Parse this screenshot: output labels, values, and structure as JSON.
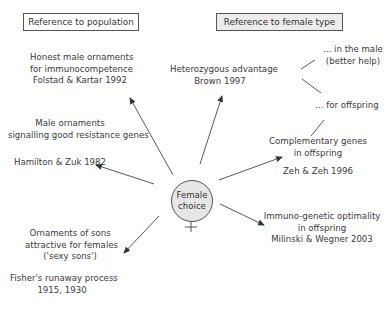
{
  "diagram": {
    "headers": {
      "population": "Reference to population",
      "female_type": "Reference to female type"
    },
    "center": {
      "line1": "Female",
      "line2": "choice",
      "symbol": "female-symbol"
    },
    "nodes": {
      "honest": {
        "line1": "Honest male ornaments",
        "line2": "for immunocompetence",
        "ref": "Folstad & Kartar 1992"
      },
      "male_orn": {
        "line1": "Male ornaments",
        "line2": "signalling good resistance genes",
        "ref": "Hamilton & Zuk 1982"
      },
      "sexy": {
        "line1": "Ornaments of sons",
        "line2": "attractive for females",
        "line3": "('sexy sons')",
        "ref1": "Fisher's runaway process",
        "ref2": "1915, 1930"
      },
      "hetero": {
        "line1": "Heterozygous advantage",
        "ref": "Brown 1997"
      },
      "in_male": {
        "line1": "... in the male",
        "line2": "(better help)"
      },
      "for_offspring": {
        "line1": "... for offspring"
      },
      "complementary": {
        "line1": "Complementary genes",
        "line2": "in offspring",
        "ref": "Zeh & Zeh 1996"
      },
      "immuno": {
        "line1": "Immuno-genetic optimality",
        "line2": "in offspring",
        "ref": "Milinski & Wegner 2003"
      }
    }
  }
}
